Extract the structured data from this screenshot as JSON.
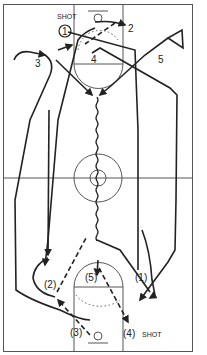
{
  "diagram": {
    "type": "basketball-play",
    "colors": {
      "line": "#222222",
      "court": "#555555",
      "background": "#ffffff"
    },
    "top_half": {
      "players": [
        {
          "id": "p1",
          "label": "1",
          "circled": true
        },
        {
          "id": "p2",
          "label": "2"
        },
        {
          "id": "p3",
          "label": "3"
        },
        {
          "id": "p4",
          "label": "4"
        },
        {
          "id": "p5",
          "label": "5"
        }
      ],
      "shot_label": "SHOT"
    },
    "bottom_half": {
      "players": [
        {
          "id": "q1",
          "label": "(1)"
        },
        {
          "id": "q2",
          "label": "(2)"
        },
        {
          "id": "q3",
          "label": "(3)"
        },
        {
          "id": "q4",
          "label": "(4)"
        },
        {
          "id": "q5",
          "label": "(5)"
        }
      ],
      "shot_label": "SHOT"
    }
  }
}
